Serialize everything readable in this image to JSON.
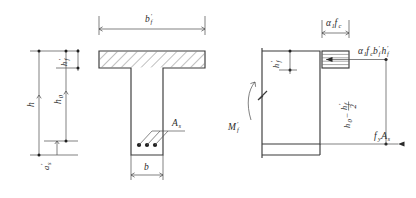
{
  "figure": {
    "background_color": "#ffffff",
    "line_color": "#3a3a3a",
    "text_color": "#2a2a2a"
  },
  "left_dimensions": {
    "overall_depth_label": "h",
    "effective_depth_label": "h",
    "effective_depth_sub": "0",
    "flange_thickness_label": "h",
    "flange_thickness_sub": "f",
    "flange_thickness_prime": "′",
    "cover_label": "a",
    "cover_sub": "s",
    "cover_prime": "′"
  },
  "section": {
    "flange_width_label": "b",
    "flange_width_sub": "f",
    "flange_width_prime": "′",
    "web_width_label": "b",
    "steel_area_label": "A",
    "steel_area_sub": "s",
    "rebar_count": 3,
    "hatch_pattern": "diagonal-45"
  },
  "stress_diagram": {
    "moment_label": "M",
    "moment_sub": "f",
    "moment_prime": "′",
    "stress_label_alpha": "α",
    "stress_label_alpha_sub": "1",
    "stress_label_f": "f",
    "stress_label_f_sub": "c",
    "compression_force_alpha": "α",
    "compression_force_alpha_sub": "1",
    "compression_force_f": "f",
    "compression_force_f_sub": "c",
    "compression_force_b": "b",
    "compression_force_b_sub": "f",
    "compression_force_b_prime": "′",
    "compression_force_h": "h",
    "compression_force_h_sub": "f",
    "compression_force_h_prime": "′",
    "tension_force_f": "f",
    "tension_force_f_sub": "y",
    "tension_force_A": "A",
    "tension_force_A_sub": "s",
    "lever_arm_h0": "h",
    "lever_arm_h0_sub": "0",
    "lever_arm_minus": "−",
    "lever_arm_hf": "h",
    "lever_arm_hf_sub": "f",
    "lever_arm_hf_prime": "′",
    "lever_arm_denominator": "2",
    "break_symbol": "zigzag-break"
  }
}
